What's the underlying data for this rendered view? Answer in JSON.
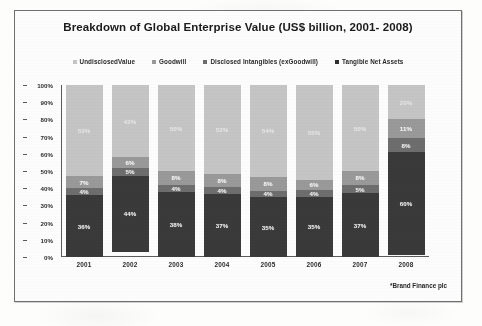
{
  "chart_data": {
    "type": "bar",
    "subtype": "stacked-100-percent",
    "title": "Breakdown of Global Enterprise Value (US$ billion, 2001- 2008)",
    "xlabel": "",
    "ylabel": "",
    "ylim": [
      0,
      100
    ],
    "ytick_labels": [
      "100%",
      "90%",
      "80%",
      "70%",
      "60%",
      "50%",
      "40%",
      "30%",
      "20%",
      "10%",
      "0%"
    ],
    "grid": false,
    "legend_position": "top",
    "categories": [
      "2001",
      "2002",
      "2003",
      "2004",
      "2005",
      "2006",
      "2007",
      "2008"
    ],
    "series": [
      {
        "name": "Undisclosed Value",
        "color": "#c6c6c6",
        "values": [
          53,
          42,
          50,
          52,
          54,
          55,
          50,
          20
        ],
        "labels": [
          "53%",
          "42%",
          "50%",
          "52%",
          "54%",
          "55%",
          "50%",
          "20%"
        ]
      },
      {
        "name": "Goodwill",
        "color": "#9a9a9a",
        "values": [
          7,
          6,
          8,
          8,
          8,
          6,
          8,
          11
        ],
        "labels": [
          "7%",
          "6%",
          "8%",
          "8%",
          "8%",
          "6%",
          "8%",
          "11%"
        ]
      },
      {
        "name": "Disclosed Intangibles (exGoodwill)",
        "color": "#6e6e6e",
        "values": [
          4,
          5,
          4,
          4,
          4,
          4,
          5,
          8
        ],
        "labels": [
          "4%",
          "5%",
          "4%",
          "4%",
          "4%",
          "4%",
          "5%",
          "8%"
        ]
      },
      {
        "name": "Tangible Net Assets",
        "color": "#3a3a3a",
        "values": [
          36,
          44,
          38,
          37,
          35,
          35,
          37,
          60
        ],
        "labels": [
          "36%",
          "44%",
          "38%",
          "37%",
          "35%",
          "35%",
          "37%",
          "60%"
        ]
      }
    ],
    "annotations": [
      "*Brand Finance plc"
    ]
  },
  "legend": {
    "items": [
      {
        "label": "UndisclosedValue",
        "color": "#c6c6c6"
      },
      {
        "label": "Goodwill",
        "color": "#9a9a9a"
      },
      {
        "label": "Disclosed Intangibles (exGoodwill)",
        "color": "#6e6e6e"
      },
      {
        "label": "Tangible Net Assets",
        "color": "#2f2f2f"
      }
    ]
  },
  "footer": {
    "source_note": "*Brand Finance plc"
  }
}
